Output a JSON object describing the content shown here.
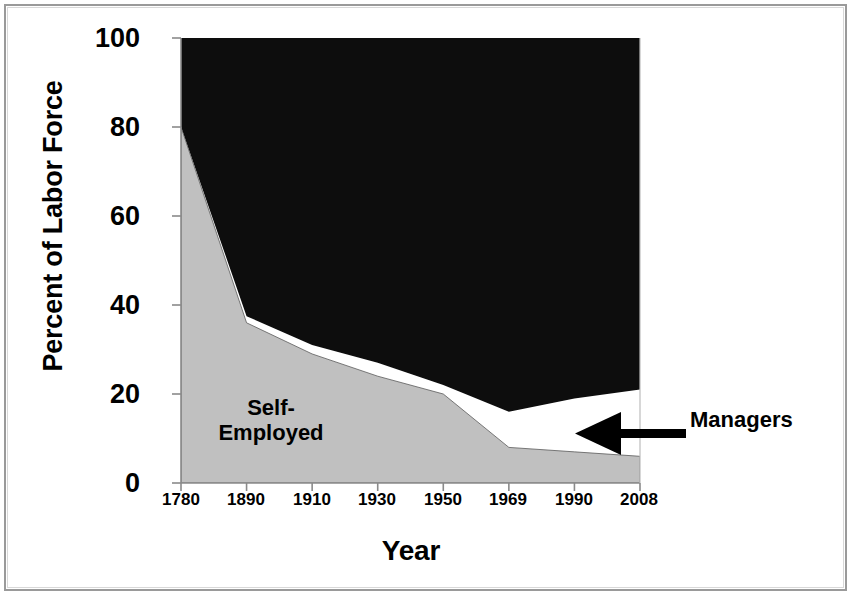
{
  "chart_data": {
    "type": "area",
    "title": "",
    "subtitle": "",
    "xlabel": "Year",
    "ylabel": "Percent of Labor Force",
    "categories": [
      "1780",
      "1890",
      "1910",
      "1930",
      "1950",
      "1969",
      "1990",
      "2008"
    ],
    "x_tick_labels": [
      "1780",
      "1890",
      "1910",
      "1930",
      "1950",
      "1969",
      "1990",
      "2008"
    ],
    "y_tick_labels": [
      "0",
      "20",
      "40",
      "60",
      "80",
      "100"
    ],
    "y_ticks": [
      0,
      20,
      40,
      60,
      80,
      100
    ],
    "ylim": [
      0,
      100
    ],
    "grid": false,
    "legend_position": "in-plot-annotations",
    "stacking": "stacked-to-100",
    "series": [
      {
        "name": "Self-Employed",
        "color": "#c0c0c0",
        "values": [
          80,
          36,
          29,
          24,
          20,
          8,
          7,
          6
        ]
      },
      {
        "name": "Managers",
        "color": "#ffffff",
        "values": [
          0,
          1.5,
          2,
          3,
          2,
          8,
          12,
          15
        ]
      },
      {
        "name": "Employees",
        "color": "#0d0d0d",
        "values": [
          20,
          62.5,
          69,
          73,
          78,
          84,
          81,
          79
        ]
      }
    ],
    "cumulative_boundaries": {
      "self_employed_top": [
        80,
        36,
        29,
        24,
        20,
        8,
        7,
        6
      ],
      "managers_top": [
        80,
        37.5,
        31,
        27,
        22,
        16,
        19,
        21
      ]
    },
    "annotations": [
      {
        "name": "Self-Employed",
        "text_lines": [
          "Self-",
          "Employed"
        ],
        "placement": "inside-gray-band"
      },
      {
        "name": "Managers",
        "text_lines": [
          "Managers"
        ],
        "placement": "right-of-plot",
        "arrow": "left-pointing-arrow"
      }
    ]
  },
  "labels": {
    "ylabel": "Percent of Labor Force",
    "xlabel": "Year",
    "self_employed_line1": "Self-",
    "self_employed_line2": "Employed",
    "managers": "Managers"
  },
  "yticks": [
    "100",
    "80",
    "60",
    "40",
    "20",
    "0"
  ],
  "xticks": [
    "1780",
    "1890",
    "1910",
    "1930",
    "1950",
    "1969",
    "1990",
    "2008"
  ],
  "colors": {
    "self_employed": "#c0c0c0",
    "managers": "#ffffff",
    "employees": "#0d0d0d",
    "axis": "#808080",
    "text": "#000000",
    "frame": "#9a9a9a"
  }
}
